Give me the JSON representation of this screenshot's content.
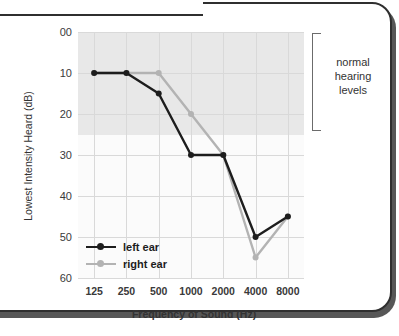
{
  "chart_data": {
    "type": "line",
    "title": "",
    "xlabel": "Frequency of Sound (Hz)",
    "ylabel": "Lowest Intensity Heard (dB)",
    "categories": [
      "125",
      "250",
      "500",
      "1000",
      "2000",
      "4000",
      "8000"
    ],
    "x_tick_labels": [
      "125",
      "250",
      "500",
      "1000",
      "2000",
      "4000",
      "8000"
    ],
    "y_tick_labels": [
      "00",
      "10",
      "20",
      "30",
      "40",
      "50",
      "60"
    ],
    "y_tick_values": [
      0,
      10,
      20,
      30,
      40,
      50,
      60
    ],
    "ylim": [
      0,
      60
    ],
    "y_axis_inverted": true,
    "grid": true,
    "legend_position": "inside-bottom-left",
    "series": [
      {
        "name": "left ear",
        "color": "#1d1d1d",
        "marker": "circle",
        "values": [
          10,
          10,
          15,
          30,
          30,
          50,
          45
        ]
      },
      {
        "name": "right ear",
        "color": "#b3b3b3",
        "marker": "circle",
        "values": [
          10,
          10,
          10,
          20,
          30,
          55,
          45
        ]
      }
    ],
    "shaded_band": {
      "label": "normal hearing levels",
      "from": 0,
      "to": 25,
      "color": "#e8e8e8"
    },
    "annotations": [
      {
        "text": "normal hearing levels",
        "position": "right-of-plot"
      }
    ]
  },
  "figure": {
    "y_axis_title": "Lowest Intensity Heard (dB)",
    "x_axis_title": "Frequency of Sound (Hz)",
    "annotation_line1": "normal",
    "annotation_line2": "hearing",
    "annotation_line3": "levels",
    "legend": {
      "left_label": "left ear",
      "right_label": "right ear"
    }
  }
}
